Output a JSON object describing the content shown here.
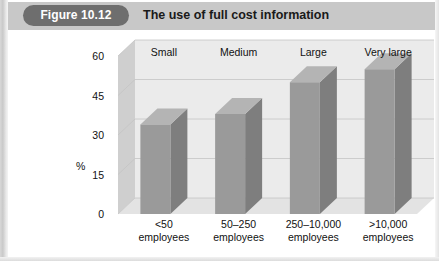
{
  "header": {
    "badge_label": "Figure 10.12",
    "title": "The use of full cost information"
  },
  "colors": {
    "header_band": "#c8c8c8",
    "badge": "#6e6e6e",
    "bar_front": "#9a9a9a",
    "bar_side": "#7e7e7e",
    "bar_top": "#b4b4b4",
    "plot_floor": "#e3e3e3",
    "plot_back": "#ebebeb",
    "plot_left": "#cfcfcf",
    "gridline": "#c4c4c4",
    "text": "#111111"
  },
  "chart_data": {
    "type": "bar",
    "title": "The use of full cost information",
    "xlabel": "",
    "ylabel": "%",
    "ylim": [
      0,
      60
    ],
    "yticks": [
      0,
      15,
      30,
      45,
      60
    ],
    "ytick_labels": [
      "0",
      "15",
      "30",
      "45",
      "60"
    ],
    "grid": true,
    "legend": "none",
    "categories": [
      "<50 employees",
      "50–250 employees",
      "250–10,000 employees",
      ">10,000 employees"
    ],
    "category_lines": [
      [
        "<50",
        "employees"
      ],
      [
        "50–250",
        "employees"
      ],
      [
        "250–10,000",
        "employees"
      ],
      [
        ">10,000",
        "employees"
      ]
    ],
    "series_labels": [
      "Small",
      "Medium",
      "Large",
      "Very large"
    ],
    "values": [
      34,
      38,
      50,
      55
    ]
  }
}
